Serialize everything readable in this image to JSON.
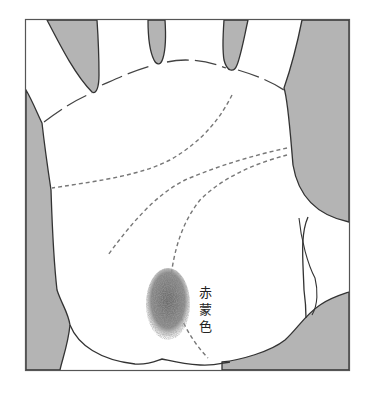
{
  "figure": {
    "colors": {
      "background": "#ffffff",
      "shade": "#b4b4b4",
      "outline": "#333333",
      "palm_lines": "#777777",
      "mark": "#6e6e6e"
    },
    "annotation": {
      "text": "赤蒙色",
      "chars": [
        "赤",
        "蒙",
        "色"
      ]
    }
  }
}
